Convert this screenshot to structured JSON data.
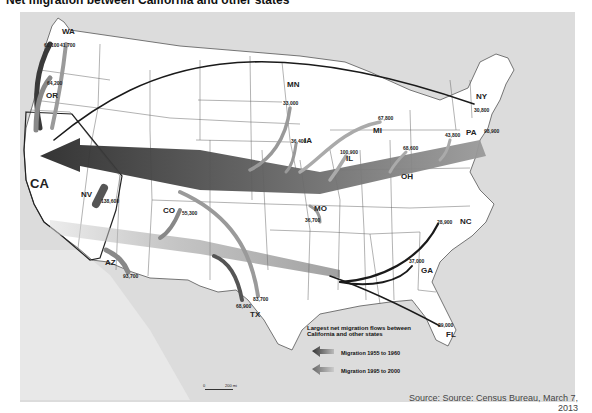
{
  "title": "Net migration between California and other states",
  "map": {
    "hub_state": "CA",
    "state_labels": [
      {
        "id": "WA",
        "label": "WA",
        "x": 62,
        "y": 34
      },
      {
        "id": "OR",
        "label": "OR",
        "x": 46,
        "y": 98
      },
      {
        "id": "CA",
        "label": "CA",
        "x": 30,
        "y": 182
      },
      {
        "id": "NV",
        "label": "NV",
        "x": 81,
        "y": 196
      },
      {
        "id": "AZ",
        "label": "AZ",
        "x": 105,
        "y": 264
      },
      {
        "id": "CO",
        "label": "CO",
        "x": 163,
        "y": 212
      },
      {
        "id": "TX",
        "label": "TX",
        "x": 250,
        "y": 316
      },
      {
        "id": "MN",
        "label": "MN",
        "x": 287,
        "y": 86
      },
      {
        "id": "IA",
        "label": "IA",
        "x": 304,
        "y": 142
      },
      {
        "id": "IL",
        "label": "IL",
        "x": 346,
        "y": 160
      },
      {
        "id": "MI",
        "label": "MI",
        "x": 373,
        "y": 132
      },
      {
        "id": "MO",
        "label": "MO",
        "x": 314,
        "y": 210
      },
      {
        "id": "OH",
        "label": "OH",
        "x": 401,
        "y": 178
      },
      {
        "id": "NY",
        "label": "NY",
        "x": 476,
        "y": 98
      },
      {
        "id": "PA",
        "label": "PA",
        "x": 466,
        "y": 134
      },
      {
        "id": "NC",
        "label": "NC",
        "x": 460,
        "y": 223
      },
      {
        "id": "GA",
        "label": "GA",
        "x": 421,
        "y": 272
      },
      {
        "id": "FL",
        "label": "FL",
        "x": 446,
        "y": 336
      }
    ],
    "flow_values": [
      {
        "state": "WA",
        "period": "1955-1960",
        "value": "60,100",
        "x": 44,
        "y": 44
      },
      {
        "state": "WA",
        "period": "1995-2000",
        "value": "41,700",
        "x": 60,
        "y": 44
      },
      {
        "state": "OR",
        "period": "1995-2000",
        "value": "64,200",
        "x": 47,
        "y": 82
      },
      {
        "state": "NV",
        "period": "1995-2000",
        "value": "138,600",
        "x": 101,
        "y": 200
      },
      {
        "state": "AZ",
        "period": "1995-2000",
        "value": "93,700",
        "x": 123,
        "y": 275
      },
      {
        "state": "CO",
        "period": "1995-2000",
        "value": "55,300",
        "x": 182,
        "y": 212
      },
      {
        "state": "TX",
        "period": "1955-1960",
        "value": "68,900",
        "x": 236,
        "y": 305
      },
      {
        "state": "TX",
        "period": "1995-2000",
        "value": "83,700",
        "x": 253,
        "y": 298
      },
      {
        "state": "MN",
        "period": "1955-1960",
        "value": "33,000",
        "x": 283,
        "y": 102
      },
      {
        "state": "IA",
        "period": "1955-1960",
        "value": "36,400",
        "x": 291,
        "y": 140
      },
      {
        "state": "IL",
        "period": "1955-1960",
        "value": "100,900",
        "x": 340,
        "y": 151
      },
      {
        "state": "MI",
        "period": "1955-1960",
        "value": "67,800",
        "x": 378,
        "y": 117
      },
      {
        "state": "MO",
        "period": "1955-1960",
        "value": "36,700",
        "x": 305,
        "y": 219
      },
      {
        "state": "OH",
        "period": "1955-1960",
        "value": "68,600",
        "x": 403,
        "y": 147
      },
      {
        "state": "PA",
        "period": "1955-1960",
        "value": "43,800",
        "x": 445,
        "y": 134
      },
      {
        "state": "NY",
        "period": "1955-1960",
        "value": "30,800",
        "x": 474,
        "y": 109
      },
      {
        "state": "NY",
        "period": "1995-2000",
        "value": "98,900",
        "x": 484,
        "y": 130
      },
      {
        "state": "NC",
        "period": "1995-2000",
        "value": "28,900",
        "x": 437,
        "y": 221
      },
      {
        "state": "GA",
        "period": "1995-2000",
        "value": "37,000",
        "x": 409,
        "y": 260
      },
      {
        "state": "FL",
        "period": "1995-2000",
        "value": "29,000",
        "x": 438,
        "y": 324
      }
    ],
    "scale_bar": {
      "start": "0",
      "end": "200 mi"
    }
  },
  "legend": {
    "title_line1": "Largest net migration flows between",
    "title_line2": "California and other states",
    "items": [
      {
        "label": "Migration 1955 to 1960",
        "color": "#3a3a3a"
      },
      {
        "label": "Migration 1995 to 2000",
        "color": "#8a8a8a"
      }
    ]
  },
  "source": {
    "line1": "Source: Source: Census Bureau, March 7,",
    "line2": "2013"
  },
  "colors": {
    "land": "#ffffff",
    "water": "#d9d9d9",
    "borders": "#555555",
    "flow_dark": "#3a3a3a",
    "flow_light": "#9a9a9a"
  }
}
